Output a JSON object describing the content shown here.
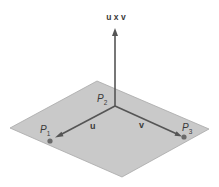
{
  "figure": {
    "type": "cross-product plane diagram",
    "colors": {
      "background": "#ffffff",
      "plane_fill": "#c9c9c9",
      "plane_edge": "#a8a8a8",
      "vector": "#555555",
      "point": "#6a6a6a",
      "text": "#3a3a3a"
    },
    "labels": {
      "normal_vector": "u x v",
      "vector_u": "u",
      "vector_v": "v",
      "p1_main": "P",
      "p1_sub": "1",
      "p2_main": "P",
      "p2_sub": "2",
      "p3_main": "P",
      "p3_sub": "3"
    },
    "geometry": {
      "plane_corners": [
        [
          10,
          128
        ],
        [
          97,
          81
        ],
        [
          209,
          129
        ],
        [
          122,
          177
        ]
      ],
      "origin_P2": [
        115,
        106
      ],
      "P1": [
        50,
        141
      ],
      "P3": [
        184,
        137
      ],
      "normal_tip": [
        115,
        28
      ]
    }
  }
}
